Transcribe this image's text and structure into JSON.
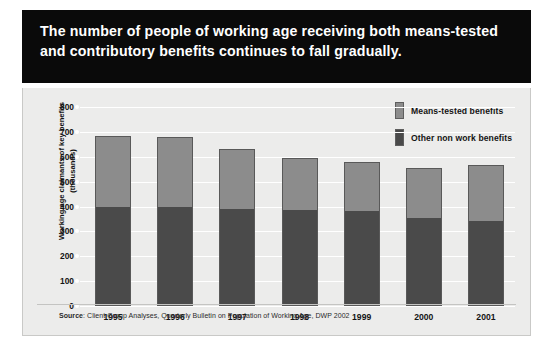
{
  "title": "The number of people of working age receiving both means-tested and contributory benefits continues to fall gradually.",
  "legend": {
    "items": [
      {
        "label": "Means-tested benefits",
        "color": "#8c8c8c"
      },
      {
        "label": "Other non work benefits",
        "color": "#4a4a4a"
      }
    ]
  },
  "source": {
    "prefix": "Source",
    "text": ": Client Group Analyses, Quarterly Bulletin on Population of Working Age, DWP 2002"
  },
  "colors": {
    "banner_background": "#0a0a0a",
    "banner_text": "#ffffff",
    "panel_background": "#ececeb",
    "gridline": "#ffffff",
    "means_tested": "#8c8c8c",
    "other_non_work": "#4a4a4a",
    "bar_outline": "#595959"
  },
  "chart_data": {
    "type": "bar",
    "stacked": true,
    "title": "The number of people of working age receiving both means-tested and contributory benefits continues to fall gradually.",
    "xlabel": "",
    "ylabel": "Working age claimants of key benefits (thousands)",
    "ylim": [
      0,
      800
    ],
    "yticks": [
      0,
      100,
      200,
      300,
      400,
      500,
      600,
      700,
      800
    ],
    "ytick_labels": [
      "0",
      "100",
      "200",
      "300",
      "400",
      "500",
      "600",
      "700",
      "800"
    ],
    "grid": true,
    "legend_position": "top-right",
    "categories": [
      "1995",
      "1996",
      "1997",
      "1998",
      "1999",
      "2000",
      "2001"
    ],
    "series": [
      {
        "name": "Other non work benefits",
        "color": "#4a4a4a",
        "values": [
          400,
          400,
          390,
          385,
          382,
          352,
          340
        ]
      },
      {
        "name": "Means-tested benefits",
        "color": "#8c8c8c",
        "values": [
          285,
          280,
          240,
          210,
          198,
          201,
          226
        ]
      }
    ],
    "totals": [
      685,
      680,
      630,
      595,
      580,
      553,
      566
    ],
    "source": "Source: Client Group Analyses, Quarterly Bulletin on Population of Working Age, DWP 2002"
  }
}
